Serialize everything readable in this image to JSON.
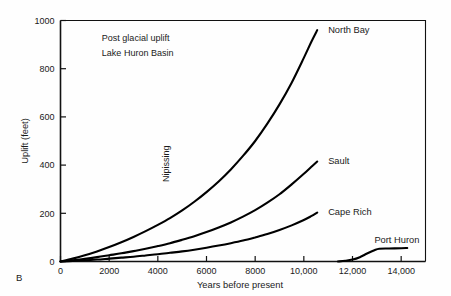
{
  "figure": {
    "panel_letter": "B",
    "annotation_lines": [
      "Post glacial uplift",
      "Lake Huron Basin"
    ],
    "inner_label": "Nipissing",
    "background_color": "#fefefe",
    "ink_color": "#000000"
  },
  "chart_data": {
    "type": "line",
    "title": "",
    "subtitle": "",
    "xlabel": "Years before present",
    "ylabel": "Uplift  (feet)",
    "xlim": [
      0,
      15000
    ],
    "ylim": [
      0,
      1000
    ],
    "grid": false,
    "legend_position": "inline-right-of-curve-ends",
    "xticks": [
      0,
      2000,
      4000,
      6000,
      8000,
      10000,
      12000,
      14000
    ],
    "xtick_labels": [
      "0",
      "2000",
      "4000",
      "6000",
      "8000",
      "10,000",
      "12,000",
      "14,000"
    ],
    "yticks": [
      0,
      200,
      400,
      600,
      800,
      1000
    ],
    "ytick_labels": [
      "0",
      "200",
      "400",
      "600",
      "800",
      "1000"
    ],
    "annotations": [
      {
        "text": "Post glacial uplift",
        "x": 1700,
        "y": 930
      },
      {
        "text": "Lake Huron Basin",
        "x": 1700,
        "y": 865
      },
      {
        "text": "Nipissing",
        "x": 4450,
        "y": 330,
        "rotation": -90
      }
    ],
    "series": [
      {
        "name": "North Bay",
        "label": "North Bay",
        "label_x": 11000,
        "label_y": 960,
        "points": [
          [
            0,
            0
          ],
          [
            500,
            12
          ],
          [
            1000,
            26
          ],
          [
            1500,
            42
          ],
          [
            2000,
            60
          ],
          [
            2500,
            80
          ],
          [
            3000,
            102
          ],
          [
            3500,
            126
          ],
          [
            4000,
            152
          ],
          [
            4500,
            180
          ],
          [
            5000,
            212
          ],
          [
            5500,
            248
          ],
          [
            6000,
            288
          ],
          [
            6500,
            332
          ],
          [
            7000,
            382
          ],
          [
            7500,
            438
          ],
          [
            8000,
            500
          ],
          [
            8500,
            572
          ],
          [
            9000,
            652
          ],
          [
            9500,
            742
          ],
          [
            10000,
            845
          ],
          [
            10300,
            910
          ],
          [
            10550,
            960
          ]
        ]
      },
      {
        "name": "Sault",
        "label": "Sault",
        "label_x": 11000,
        "label_y": 418,
        "points": [
          [
            0,
            0
          ],
          [
            500,
            5
          ],
          [
            1000,
            11
          ],
          [
            1500,
            18
          ],
          [
            2000,
            26
          ],
          [
            2500,
            34
          ],
          [
            3000,
            43
          ],
          [
            3500,
            53
          ],
          [
            4000,
            64
          ],
          [
            4500,
            76
          ],
          [
            5000,
            90
          ],
          [
            5500,
            105
          ],
          [
            6000,
            122
          ],
          [
            6500,
            141
          ],
          [
            7000,
            162
          ],
          [
            7500,
            186
          ],
          [
            8000,
            213
          ],
          [
            8500,
            244
          ],
          [
            9000,
            279
          ],
          [
            9500,
            320
          ],
          [
            10000,
            364
          ],
          [
            10300,
            392
          ],
          [
            10550,
            415
          ]
        ]
      },
      {
        "name": "Cape Rich",
        "label": "Cape Rich",
        "label_x": 11000,
        "label_y": 205,
        "points": [
          [
            0,
            0
          ],
          [
            500,
            2
          ],
          [
            1000,
            5
          ],
          [
            1500,
            8
          ],
          [
            2000,
            12
          ],
          [
            2500,
            16
          ],
          [
            3000,
            20
          ],
          [
            3500,
            25
          ],
          [
            4000,
            30
          ],
          [
            4500,
            36
          ],
          [
            5000,
            42
          ],
          [
            5500,
            49
          ],
          [
            6000,
            57
          ],
          [
            6500,
            66
          ],
          [
            7000,
            76
          ],
          [
            7500,
            87
          ],
          [
            8000,
            100
          ],
          [
            8500,
            114
          ],
          [
            9000,
            131
          ],
          [
            9500,
            150
          ],
          [
            10000,
            172
          ],
          [
            10300,
            188
          ],
          [
            10550,
            203
          ]
        ]
      },
      {
        "name": "Port Huron",
        "label": "Port Huron",
        "label_x": 12900,
        "label_y": 90,
        "points": [
          [
            11400,
            0
          ],
          [
            11700,
            3
          ],
          [
            12000,
            8
          ],
          [
            12300,
            18
          ],
          [
            12600,
            33
          ],
          [
            12900,
            47
          ],
          [
            13100,
            53
          ],
          [
            13500,
            54
          ],
          [
            14000,
            55
          ],
          [
            14250,
            56
          ]
        ]
      }
    ]
  }
}
